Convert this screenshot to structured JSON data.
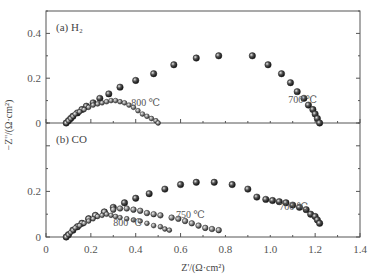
{
  "chart_data": {
    "type": "scatter",
    "title": "",
    "xlabel": "Z'/(Ω·cm²)",
    "ylabel": "−Z''/(Ω·cm²)",
    "xlim": [
      0,
      1.4
    ],
    "x_ticks": [
      "0",
      "0.2",
      "0.4",
      "0.6",
      "0.8",
      "1.0",
      "1.2",
      "1.4"
    ],
    "grid": false,
    "legend": "none (inline annotations)",
    "panels": [
      {
        "label": "(a) H₂",
        "ylim": [
          0,
          0.5
        ],
        "y_ticks": [
          "0",
          "0.2",
          "0.4"
        ],
        "series": [
          {
            "name": "700 ℃",
            "marker": "filled-shaded-circle-large",
            "annotation": {
              "text": "700 ℃",
              "x": 1.08,
              "y": 0.09
            },
            "x": [
              0.09,
              0.1,
              0.11,
              0.12,
              0.14,
              0.16,
              0.18,
              0.21,
              0.24,
              0.28,
              0.33,
              0.4,
              0.48,
              0.57,
              0.67,
              0.77,
              0.92,
              0.99,
              1.05,
              1.09,
              1.12,
              1.15,
              1.17,
              1.19,
              1.2,
              1.21,
              1.22
            ],
            "y": [
              0.0,
              0.01,
              0.02,
              0.03,
              0.045,
              0.06,
              0.075,
              0.09,
              0.11,
              0.13,
              0.16,
              0.19,
              0.22,
              0.26,
              0.29,
              0.3,
              0.3,
              0.26,
              0.22,
              0.18,
              0.14,
              0.11,
              0.08,
              0.06,
              0.04,
              0.02,
              0.0
            ]
          },
          {
            "name": "800 ℃",
            "marker": "open-shaded-circle-small",
            "annotation": {
              "text": "800 ℃",
              "x": 0.38,
              "y": 0.075
            },
            "x": [
              0.09,
              0.1,
              0.11,
              0.12,
              0.13,
              0.15,
              0.17,
              0.19,
              0.21,
              0.23,
              0.25,
              0.27,
              0.29,
              0.31,
              0.33,
              0.35,
              0.37,
              0.39,
              0.41,
              0.43,
              0.45,
              0.47,
              0.49,
              0.5
            ],
            "y": [
              0.0,
              0.01,
              0.02,
              0.03,
              0.04,
              0.05,
              0.06,
              0.07,
              0.08,
              0.085,
              0.09,
              0.095,
              0.1,
              0.1,
              0.095,
              0.09,
              0.08,
              0.07,
              0.055,
              0.04,
              0.03,
              0.02,
              0.01,
              0.0
            ]
          }
        ]
      },
      {
        "label": "(b) CO",
        "ylim": [
          0,
          0.5
        ],
        "y_ticks": [
          "0",
          "0.2"
        ],
        "series": [
          {
            "name": "700 ℃",
            "marker": "filled-shaded-circle-large",
            "annotation": {
              "text": "700 ℃",
              "x": 1.04,
              "y": 0.12
            },
            "x": [
              0.09,
              0.1,
              0.12,
              0.14,
              0.16,
              0.19,
              0.22,
              0.26,
              0.3,
              0.35,
              0.4,
              0.46,
              0.53,
              0.6,
              0.67,
              0.75,
              0.83,
              0.9,
              0.94,
              0.98,
              1.01,
              1.04,
              1.07,
              1.1,
              1.13,
              1.16,
              1.18,
              1.2,
              1.21,
              1.22
            ],
            "y": [
              0.0,
              0.01,
              0.03,
              0.045,
              0.06,
              0.08,
              0.095,
              0.11,
              0.13,
              0.15,
              0.17,
              0.19,
              0.21,
              0.23,
              0.24,
              0.24,
              0.23,
              0.21,
              0.175,
              0.165,
              0.16,
              0.155,
              0.15,
              0.14,
              0.13,
              0.12,
              0.1,
              0.09,
              0.075,
              0.06
            ]
          },
          {
            "name": "750 ℃",
            "marker": "open-shaded-circle-medium",
            "annotation": {
              "text": "750 ℃",
              "x": 0.58,
              "y": 0.085
            },
            "x": [
              0.09,
              0.1,
              0.12,
              0.14,
              0.16,
              0.19,
              0.22,
              0.26,
              0.3,
              0.33,
              0.36,
              0.39,
              0.42,
              0.45,
              0.48,
              0.51,
              0.56,
              0.59,
              0.62,
              0.65,
              0.68,
              0.71,
              0.74,
              0.77
            ],
            "y": [
              0.0,
              0.01,
              0.03,
              0.045,
              0.06,
              0.08,
              0.095,
              0.11,
              0.12,
              0.125,
              0.125,
              0.12,
              0.115,
              0.105,
              0.1,
              0.095,
              0.085,
              0.08,
              0.07,
              0.06,
              0.05,
              0.04,
              0.035,
              0.03
            ]
          },
          {
            "name": "800 ℃",
            "marker": "open-shaded-circle-small",
            "annotation": {
              "text": "800 ℃",
              "x": 0.3,
              "y": 0.05
            },
            "x": [
              0.09,
              0.1,
              0.11,
              0.12,
              0.13,
              0.15,
              0.17,
              0.19,
              0.21,
              0.23,
              0.25,
              0.27,
              0.29,
              0.31,
              0.33,
              0.36,
              0.39,
              0.42,
              0.45,
              0.48,
              0.51,
              0.53,
              0.55
            ],
            "y": [
              0.0,
              0.01,
              0.02,
              0.03,
              0.04,
              0.05,
              0.06,
              0.07,
              0.08,
              0.09,
              0.095,
              0.1,
              0.095,
              0.09,
              0.085,
              0.08,
              0.075,
              0.07,
              0.06,
              0.05,
              0.045,
              0.035,
              0.03
            ]
          }
        ]
      }
    ]
  }
}
